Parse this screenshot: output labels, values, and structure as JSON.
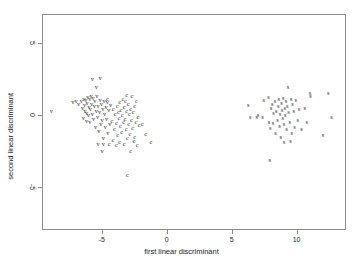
{
  "chart_data": {
    "type": "scatter",
    "title": "",
    "xlabel": "first linear discriminant",
    "ylabel": "second linear discriminant",
    "xlim": [
      -9.6,
      13.8
    ],
    "ylim": [
      -8.0,
      7.0
    ],
    "grid": false,
    "legend": "none",
    "xticks": [
      -5,
      0,
      5,
      10
    ],
    "xticklabels": [
      "-5",
      "0",
      "5",
      "10"
    ],
    "yticks": [
      5,
      0,
      -5
    ],
    "yticklabels": [
      "5",
      "0",
      "-5"
    ],
    "point_marker_style": "class-letter",
    "series": [
      {
        "name": "v",
        "label": "v",
        "color": "#1b1b1b",
        "points": [
          [
            -8.95,
            0.3
          ],
          [
            -7.3,
            0.95
          ],
          [
            -7.05,
            1.05
          ],
          [
            -6.85,
            0.85
          ],
          [
            -6.65,
            1.0
          ],
          [
            -6.55,
            0.55
          ],
          [
            -6.45,
            1.2
          ],
          [
            -6.4,
            0.75
          ],
          [
            -6.35,
            0.35
          ],
          [
            -6.3,
            1.1
          ],
          [
            -6.25,
            0.2
          ],
          [
            -6.2,
            0.9
          ],
          [
            -6.15,
            1.3
          ],
          [
            -6.1,
            0.05
          ],
          [
            -6.05,
            0.6
          ],
          [
            -6.0,
            1.15
          ],
          [
            -6.0,
            -0.45
          ],
          [
            -5.95,
            0.45
          ],
          [
            -5.9,
            1.35
          ],
          [
            -5.85,
            0.8
          ],
          [
            -5.8,
            0.1
          ],
          [
            -5.8,
            2.55
          ],
          [
            -5.75,
            1.25
          ],
          [
            -5.7,
            -0.25
          ],
          [
            -5.65,
            0.65
          ],
          [
            -5.6,
            1.05
          ],
          [
            -5.55,
            -0.75
          ],
          [
            -5.5,
            0.35
          ],
          [
            -5.5,
            2.0
          ],
          [
            -5.45,
            1.4
          ],
          [
            -5.4,
            -0.1
          ],
          [
            -5.35,
            0.7
          ],
          [
            -5.3,
            -1.05
          ],
          [
            -5.25,
            0.25
          ],
          [
            -5.2,
            1.1
          ],
          [
            -5.2,
            2.6
          ],
          [
            -5.15,
            -0.55
          ],
          [
            -5.1,
            0.85
          ],
          [
            -5.05,
            -0.3
          ],
          [
            -5.0,
            0.5
          ],
          [
            -4.95,
            -1.55
          ],
          [
            -4.9,
            1.0
          ],
          [
            -4.85,
            0.15
          ],
          [
            -4.8,
            -0.8
          ],
          [
            -4.75,
            0.6
          ],
          [
            -4.7,
            -0.2
          ],
          [
            -4.65,
            0.95
          ],
          [
            -4.6,
            -1.2
          ],
          [
            -4.55,
            0.4
          ],
          [
            -4.45,
            -0.6
          ],
          [
            -5.35,
            -1.95
          ],
          [
            -4.95,
            -1.95
          ],
          [
            -5.05,
            -2.45
          ],
          [
            -6.25,
            -0.35
          ],
          [
            -6.5,
            -0.15
          ],
          [
            -4.4,
            0.75
          ]
        ]
      },
      {
        "name": "c",
        "label": "c",
        "color": "#1b1b1b",
        "points": [
          [
            -4.3,
            -0.35
          ],
          [
            -4.2,
            0.45
          ],
          [
            -4.1,
            -0.9
          ],
          [
            -4.05,
            0.1
          ],
          [
            -3.95,
            -0.5
          ],
          [
            -3.9,
            0.7
          ],
          [
            -3.85,
            -1.35
          ],
          [
            -3.8,
            0.25
          ],
          [
            -3.75,
            -0.15
          ],
          [
            -3.7,
            0.95
          ],
          [
            -3.65,
            -0.7
          ],
          [
            -3.6,
            0.4
          ],
          [
            -3.55,
            -1.1
          ],
          [
            -3.5,
            0.05
          ],
          [
            -3.45,
            1.2
          ],
          [
            -3.4,
            -0.45
          ],
          [
            -3.35,
            0.6
          ],
          [
            -3.3,
            -0.2
          ],
          [
            -3.25,
            1.05
          ],
          [
            -3.2,
            -0.95
          ],
          [
            -3.15,
            0.3
          ],
          [
            -3.1,
            -1.55
          ],
          [
            -3.05,
            0.8
          ],
          [
            -3.0,
            -0.6
          ],
          [
            -2.95,
            0.15
          ],
          [
            -2.9,
            -1.25
          ],
          [
            -2.85,
            0.5
          ],
          [
            -2.8,
            -0.3
          ],
          [
            -2.75,
            1.35
          ],
          [
            -2.7,
            -0.85
          ],
          [
            -2.65,
            0.25
          ],
          [
            -2.6,
            -1.75
          ],
          [
            -2.55,
            0.65
          ],
          [
            -2.45,
            -0.4
          ],
          [
            -2.4,
            1.0
          ],
          [
            -2.3,
            -0.1
          ],
          [
            -2.2,
            -0.65
          ],
          [
            -1.95,
            -0.55
          ],
          [
            -1.7,
            -1.25
          ],
          [
            -1.3,
            -1.85
          ],
          [
            -3.1,
            -4.1
          ],
          [
            -2.85,
            -2.45
          ],
          [
            -3.35,
            -1.95
          ],
          [
            -3.7,
            -1.8
          ],
          [
            -4.2,
            -1.7
          ],
          [
            -4.5,
            -1.95
          ],
          [
            -3.95,
            -2.0
          ],
          [
            -2.55,
            -1.45
          ],
          [
            -2.35,
            -2.0
          ],
          [
            -4.65,
            1.15
          ],
          [
            -3.15,
            1.45
          ]
        ]
      },
      {
        "name": "s",
        "label": "s",
        "color": "#1b1b1b",
        "points": [
          [
            6.2,
            0.75
          ],
          [
            6.35,
            -0.05
          ],
          [
            6.85,
            -0.1
          ],
          [
            6.95,
            0.05
          ],
          [
            7.3,
            -0.05
          ],
          [
            7.4,
            1.1
          ],
          [
            7.75,
            1.3
          ],
          [
            7.8,
            -0.45
          ],
          [
            7.9,
            -0.85
          ],
          [
            7.95,
            0.55
          ],
          [
            8.05,
            0.85
          ],
          [
            8.1,
            -0.5
          ],
          [
            8.15,
            0.2
          ],
          [
            8.25,
            1.0
          ],
          [
            8.3,
            -1.2
          ],
          [
            8.35,
            0.35
          ],
          [
            8.45,
            -0.3
          ],
          [
            8.5,
            0.65
          ],
          [
            8.55,
            1.15
          ],
          [
            8.6,
            -0.7
          ],
          [
            8.65,
            0.1
          ],
          [
            8.7,
            -1.45
          ],
          [
            8.75,
            0.9
          ],
          [
            8.8,
            0.4
          ],
          [
            8.85,
            -0.15
          ],
          [
            8.9,
            1.25
          ],
          [
            8.95,
            -0.6
          ],
          [
            9.0,
            0.55
          ],
          [
            9.05,
            0.05
          ],
          [
            9.1,
            1.05
          ],
          [
            9.15,
            -0.95
          ],
          [
            9.2,
            0.7
          ],
          [
            9.25,
            2.0
          ],
          [
            9.3,
            0.25
          ],
          [
            9.4,
            -0.4
          ],
          [
            9.5,
            1.2
          ],
          [
            9.55,
            -1.2
          ],
          [
            9.6,
            0.8
          ],
          [
            9.7,
            0.3
          ],
          [
            9.75,
            -0.75
          ],
          [
            9.85,
            1.1
          ],
          [
            10.0,
            -0.3
          ],
          [
            10.1,
            0.45
          ],
          [
            10.3,
            -0.9
          ],
          [
            10.55,
            0.55
          ],
          [
            10.7,
            -0.45
          ],
          [
            10.95,
            1.55
          ],
          [
            11.0,
            1.4
          ],
          [
            11.95,
            -1.35
          ],
          [
            12.35,
            1.55
          ],
          [
            12.6,
            -0.05
          ],
          [
            7.85,
            -3.05
          ],
          [
            9.45,
            -1.75
          ],
          [
            8.95,
            -1.8
          ]
        ]
      }
    ]
  },
  "axes": {
    "x_label": "first linear discriminant",
    "y_label": "second linear discriminant",
    "frame_color": "#8c8c8c"
  }
}
